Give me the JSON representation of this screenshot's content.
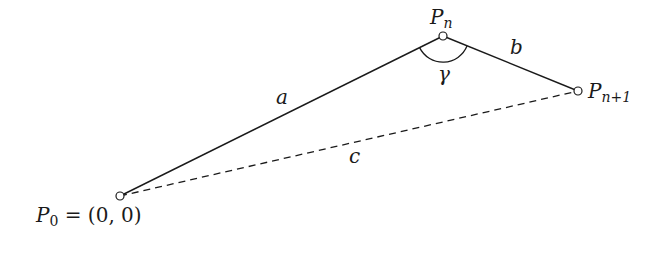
{
  "diagram": {
    "type": "triangle-geometry",
    "points": [
      {
        "id": "P0",
        "label": "P",
        "sub": "0",
        "suffix": " = (0, 0)",
        "x": 120,
        "y": 196
      },
      {
        "id": "Pn",
        "label": "P",
        "sub": "n",
        "x": 443,
        "y": 36
      },
      {
        "id": "Pn1",
        "label": "P",
        "sub": "n+1",
        "x": 578,
        "y": 91
      }
    ],
    "edges": [
      {
        "from": "P0",
        "to": "Pn",
        "label": "a",
        "style": "solid"
      },
      {
        "from": "Pn",
        "to": "Pn1",
        "label": "b",
        "style": "solid"
      },
      {
        "from": "P0",
        "to": "Pn1",
        "label": "c",
        "style": "dashed"
      }
    ],
    "angle": {
      "at": "Pn",
      "label": "γ"
    },
    "colors": {
      "stroke": "#1a1a1a",
      "background": "#ffffff"
    }
  }
}
